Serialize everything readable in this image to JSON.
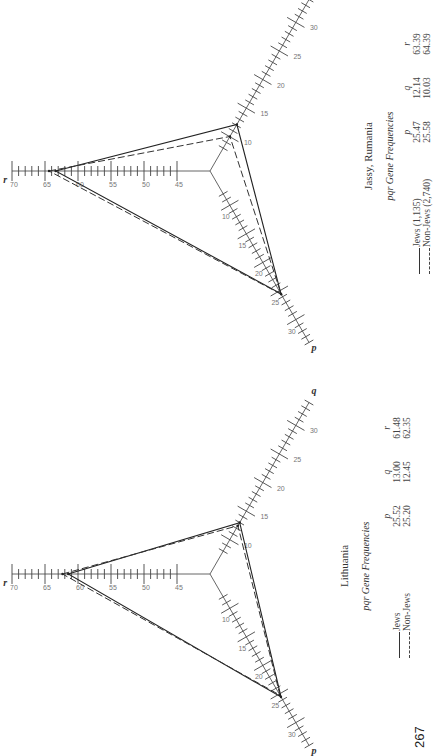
{
  "page_number": "267",
  "chart_data": [
    {
      "type": "triangular-radar",
      "title": "Lithuania",
      "subtitle": "pqr Gene Frequencies",
      "axes": [
        {
          "name": "r",
          "ticks": [
            45,
            50,
            55,
            60,
            65,
            70
          ],
          "range": [
            40,
            70
          ]
        },
        {
          "name": "q",
          "ticks": [
            10,
            15,
            20,
            25,
            30
          ],
          "range": [
            4,
            34
          ]
        },
        {
          "name": "p",
          "ticks": [
            10,
            15,
            20,
            25,
            30
          ],
          "range": [
            4,
            34
          ]
        }
      ],
      "columns": [
        "p",
        "q",
        "r"
      ],
      "series": [
        {
          "name": "Jews",
          "style": "solid",
          "p": 25.52,
          "q": 13.0,
          "r": 61.48
        },
        {
          "name": "Non-Jews",
          "style": "dashed",
          "p": 25.2,
          "q": 12.45,
          "r": 62.35
        }
      ]
    },
    {
      "type": "triangular-radar",
      "title": "Jassy, Rumania",
      "subtitle": "pqr Gene Frequencies",
      "axes": [
        {
          "name": "r",
          "ticks": [
            45,
            50,
            55,
            60,
            65,
            70
          ],
          "range": [
            40,
            70
          ]
        },
        {
          "name": "q",
          "ticks": [
            10,
            15,
            20,
            25,
            30
          ],
          "range": [
            4,
            34
          ]
        },
        {
          "name": "p",
          "ticks": [
            10,
            15,
            20,
            25,
            30
          ],
          "range": [
            4,
            34
          ]
        }
      ],
      "columns": [
        "p",
        "q",
        "r"
      ],
      "series": [
        {
          "name": "Jews (1,135)",
          "style": "solid",
          "p": 25.47,
          "q": 12.14,
          "r": 63.39
        },
        {
          "name": "Non-Jews (2,740)",
          "style": "dashed",
          "p": 25.58,
          "q": 10.03,
          "r": 64.39
        }
      ]
    }
  ]
}
